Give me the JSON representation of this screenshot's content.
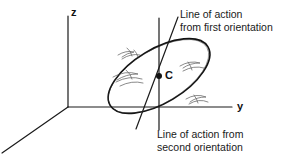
{
  "figure": {
    "title": "",
    "axes": {
      "z_label": "z",
      "y_label": "y",
      "x_label": ""
    },
    "points": [
      {
        "name": "centroid",
        "label": "C",
        "x": 159,
        "y": 76
      }
    ],
    "annotations": [
      {
        "name": "line-of-action-first",
        "line1": "Line of action",
        "line2": "from first orientation"
      },
      {
        "name": "line-of-action-second",
        "line1": "Line of action  from",
        "line2": "second orientation"
      }
    ],
    "colors": {
      "stroke": "#1a1a1a",
      "background": "#ffffff",
      "hatch": "#555555"
    }
  }
}
